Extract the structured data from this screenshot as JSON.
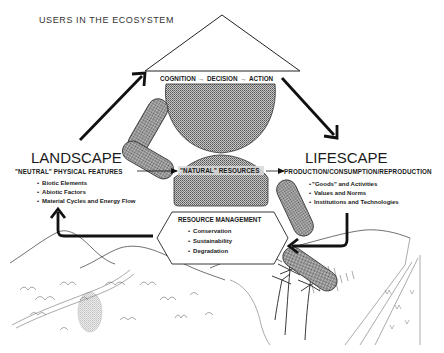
{
  "title": "USERS IN THE ECOSYSTEM",
  "decision_chain": {
    "cognition": "COGNITION",
    "decision": "DECISION",
    "action": "ACTION",
    "arrow": "→"
  },
  "landscape": {
    "heading": "LANDSCAPE",
    "subheading": "\"NEUTRAL\" PHYSICAL FEATURES",
    "bullets": [
      "Biotic Elements",
      "Abiotic Factors",
      "Material Cycles and Energy Flow"
    ]
  },
  "natural_resources": {
    "label": "\"NATURAL\" RESOURCES"
  },
  "lifescape": {
    "heading": "LIFESCAPE",
    "subheading": "PRODUCTION/CONSUMPTION/REPRODUCTION",
    "bullets": [
      "\"Goods\" and Activities",
      "Values and Norms",
      "Institutions and Technologies"
    ]
  },
  "resource_management": {
    "heading": "RESOURCE MANAGEMENT",
    "bullets": [
      "Conservation",
      "Sustainability",
      "Degradation"
    ]
  },
  "bullet_char": "•",
  "colors": {
    "ink": "#1a1a1a",
    "stipple_fill": "#a9a9a9",
    "background": "#ffffff"
  }
}
